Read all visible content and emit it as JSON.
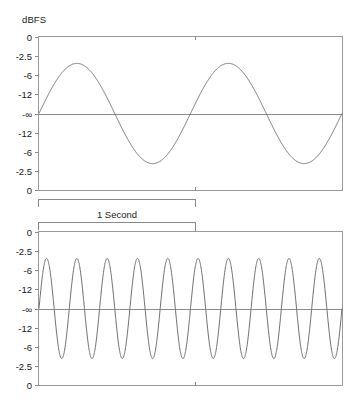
{
  "figure": {
    "axis_title": "dBFS",
    "duration_label": "1 Second",
    "line_color": "#6e6e6e",
    "frame_color": "#9a9a9a",
    "text_color": "#1a1a1a",
    "background": "#ffffff"
  },
  "chart_data": [
    {
      "type": "line",
      "title": "",
      "subtitle": "",
      "name": "low-frequency-sine",
      "xlabel": "1 Second",
      "ylabel": "dBFS",
      "grid": false,
      "legend": null,
      "annotations": [
        "1 Second"
      ],
      "x_range_seconds": [
        0,
        2.0
      ],
      "cycles_visible": 2,
      "frequency_cycles_per_second": 1,
      "peak_level_dbfs": -6,
      "trough_level_dbfs": -6,
      "phase_start_dbfs": "-inf",
      "ytick_labels": [
        "0",
        "-2.5",
        "-6",
        "-12",
        "-∞",
        "-12",
        "-6",
        "-2.5",
        "0"
      ],
      "ytick_values": [
        1.0,
        0.75,
        0.5,
        0.25,
        0.0,
        -0.25,
        -0.5,
        -0.75,
        -1.0
      ],
      "ylim_labels": [
        "0",
        "0"
      ],
      "xtick_positions_seconds": [
        1.0
      ],
      "series": [
        {
          "name": "sine",
          "values": [
            0,
            0.309,
            0.588,
            0.809,
            0.951,
            1.0,
            0.951,
            0.809,
            0.588,
            0.309,
            0,
            -0.309,
            -0.588,
            -0.809,
            -0.951,
            -1.0,
            -0.951,
            -0.809,
            -0.588,
            -0.309,
            0,
            0.309,
            0.588,
            0.809,
            0.951,
            1.0,
            0.951,
            0.809,
            0.588,
            0.309,
            0,
            -0.309,
            -0.588,
            -0.809,
            -0.951,
            -1.0,
            -0.951,
            -0.809,
            -0.588,
            -0.309,
            0
          ]
        }
      ]
    },
    {
      "type": "line",
      "title": "",
      "subtitle": "",
      "name": "high-frequency-sine",
      "xlabel": "1 Second",
      "ylabel": "dBFS",
      "grid": false,
      "legend": null,
      "annotations": [
        "1 Second"
      ],
      "x_range_seconds": [
        0,
        2.0
      ],
      "cycles_visible": 10,
      "frequency_cycles_per_second": 5,
      "peak_level_dbfs": -6,
      "trough_level_dbfs": -6,
      "phase_start_dbfs": "-inf",
      "ytick_labels": [
        "0",
        "-2.5",
        "-6",
        "-12",
        "-∞",
        "-12",
        "-6",
        "-2.5",
        "0"
      ],
      "ytick_values": [
        1.0,
        0.75,
        0.5,
        0.25,
        0.0,
        -0.25,
        -0.5,
        -0.75,
        -1.0
      ],
      "ylim_labels": [
        "0",
        "0"
      ],
      "xtick_positions_seconds": [
        1.0
      ],
      "series": [
        {
          "name": "sine",
          "values": [
            0,
            1.0,
            0,
            -1.0,
            0,
            1.0,
            0,
            -1.0,
            0,
            1.0,
            0,
            -1.0,
            0,
            1.0,
            0,
            -1.0,
            0,
            1.0,
            0,
            -1.0,
            0
          ]
        }
      ]
    }
  ]
}
